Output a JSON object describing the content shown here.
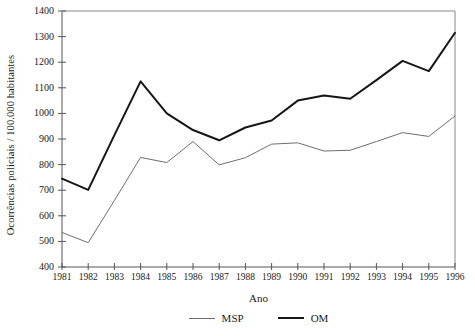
{
  "chart_data": {
    "type": "line",
    "title": "",
    "xlabel": "Ano",
    "ylabel": "Ocorrências policiais / 100.000 habitantes",
    "x": [
      1981,
      1982,
      1983,
      1984,
      1985,
      1986,
      1987,
      1988,
      1989,
      1990,
      1991,
      1992,
      1993,
      1994,
      1995,
      1996
    ],
    "xtick_labels": [
      "1981",
      "1982",
      "1983",
      "1984",
      "1985",
      "1986",
      "1987",
      "1988",
      "1989",
      "1990",
      "1991",
      "1992",
      "1993",
      "1994",
      "1995",
      "1996"
    ],
    "ytick_labels": [
      "400",
      "500",
      "600",
      "700",
      "800",
      "900",
      "1000",
      "1100",
      "1200",
      "1300",
      "1400"
    ],
    "yticks": [
      400,
      500,
      600,
      700,
      800,
      900,
      1000,
      1100,
      1200,
      1300,
      1400
    ],
    "ylim": [
      400,
      1400
    ],
    "xlim": [
      1981,
      1996
    ],
    "grid": false,
    "legend_position": "bottom-center",
    "series": [
      {
        "name": "MSP",
        "color": "#6e6e6e",
        "line_width": 1,
        "values": [
          535,
          495,
          660,
          828,
          808,
          890,
          799,
          827,
          880,
          885,
          853,
          856,
          890,
          925,
          910,
          990
        ]
      },
      {
        "name": "OM",
        "color": "#161616",
        "line_width": 2,
        "values": [
          745,
          701,
          915,
          1125,
          1000,
          935,
          895,
          945,
          972,
          1050,
          1070,
          1057,
          1130,
          1205,
          1165,
          1315
        ]
      }
    ]
  },
  "axes": {
    "y_title": "Ocorrências policiais / 100.000 habitantes",
    "x_title": "Ano"
  },
  "legend": {
    "items": [
      {
        "label": "MSP"
      },
      {
        "label": "OM"
      }
    ]
  }
}
